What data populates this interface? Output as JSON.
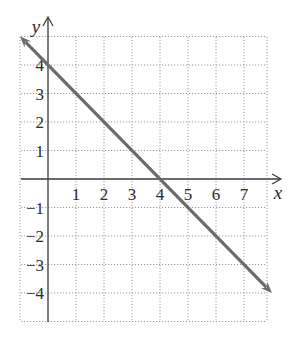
{
  "chart_data": {
    "type": "line",
    "title": "",
    "xlabel": "x",
    "ylabel": "y",
    "xlim": [
      -1,
      7.8
    ],
    "ylim": [
      -5,
      5
    ],
    "grid": true,
    "grid_style": "dotted",
    "x_ticks": [
      1,
      2,
      3,
      4,
      5,
      6,
      7
    ],
    "x_tick_labels": [
      "1",
      "2",
      "3",
      "4",
      "5",
      "6",
      "7"
    ],
    "y_ticks": [
      4,
      3,
      2,
      1,
      -1,
      -2,
      -3,
      -4
    ],
    "y_tick_labels": [
      "4",
      "3",
      "2",
      "1",
      "−1",
      "−2",
      "−3",
      "−4"
    ],
    "series": [
      {
        "name": "y = -x + 4",
        "equation": "y = -x + 4",
        "x": [
          -1,
          0,
          4,
          8
        ],
        "y": [
          5,
          4,
          0,
          -4
        ],
        "arrows": "both",
        "color": "#6b6b6b"
      }
    ],
    "x_intercept": [
      4,
      0
    ],
    "y_intercept": [
      0,
      4
    ],
    "legend": "none"
  },
  "colors": {
    "line": "#6b6b6b",
    "axis": "#3a3a3a",
    "grid": "#9a9a9a",
    "text": "#2a2a2a"
  }
}
